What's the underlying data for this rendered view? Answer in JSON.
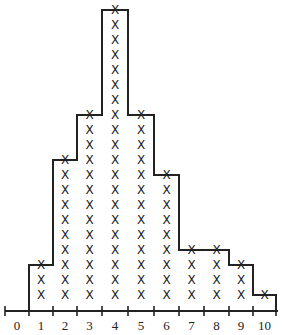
{
  "chart_data": {
    "type": "dot-plot-histogram",
    "title": "",
    "xlabel": "",
    "ylabel": "",
    "categories": [
      "0",
      "1",
      "2",
      "3",
      "4",
      "5",
      "6",
      "7",
      "8",
      "9",
      "10"
    ],
    "values": [
      0,
      3,
      10,
      13,
      20,
      13,
      9,
      4,
      4,
      3,
      1
    ],
    "marker": "X",
    "total": 80,
    "outline": "step",
    "grid": false,
    "xlim": [
      0,
      10
    ]
  },
  "colors": {
    "ink": "#222222",
    "background": "#ffffff"
  }
}
